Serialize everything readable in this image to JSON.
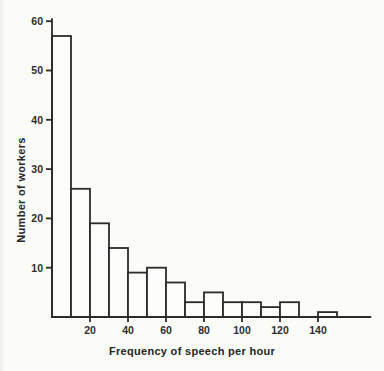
{
  "chart_data": {
    "type": "bar",
    "subtype": "histogram",
    "title": "",
    "xlabel": "Frequency of speech per hour",
    "ylabel": "Number of workers",
    "bin_start": 0,
    "bin_width": 10,
    "categories": [
      "0-10",
      "10-20",
      "20-30",
      "30-40",
      "40-50",
      "50-60",
      "60-70",
      "70-80",
      "80-90",
      "90-100",
      "100-110",
      "110-120",
      "120-130",
      "130-140",
      "140-150"
    ],
    "values": [
      57,
      26,
      19,
      14,
      9,
      10,
      7,
      3,
      5,
      3,
      3,
      2,
      3,
      0,
      1
    ],
    "x_ticks": [
      20,
      40,
      60,
      80,
      100,
      120,
      140
    ],
    "y_ticks": [
      10,
      20,
      30,
      40,
      50,
      60
    ],
    "xlim": [
      0,
      168
    ],
    "ylim": [
      0,
      60.6
    ],
    "grid": false,
    "legend": "none",
    "line_color": "#2b2b2b",
    "text_color": "#2e2e2e",
    "background_color": "#fbfbf8"
  }
}
